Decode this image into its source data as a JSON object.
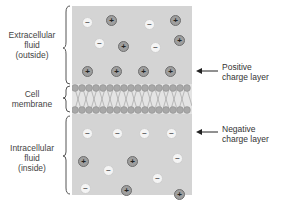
{
  "diagram": {
    "regions": [
      {
        "id": "extracellular",
        "label_lines": [
          "Extracellular",
          "fluid",
          "(outside)"
        ]
      },
      {
        "id": "membrane",
        "label_lines": [
          "Cell",
          "membrane"
        ]
      },
      {
        "id": "intracellular",
        "label_lines": [
          "Intracellular",
          "fluid",
          "(inside)"
        ]
      }
    ],
    "annotations": [
      {
        "id": "positive",
        "label_lines": [
          "Positive",
          "charge layer"
        ]
      },
      {
        "id": "negative",
        "label_lines": [
          "Negative",
          "charge layer"
        ]
      }
    ],
    "ions": {
      "positive_symbol": "+",
      "negative_symbol": "−"
    },
    "colors": {
      "fluid": "#d4d4d4",
      "positive_ion": "#9e9e9e",
      "negative_ion": "#f4f4f4",
      "membrane_head": "#a8a8a8"
    }
  }
}
